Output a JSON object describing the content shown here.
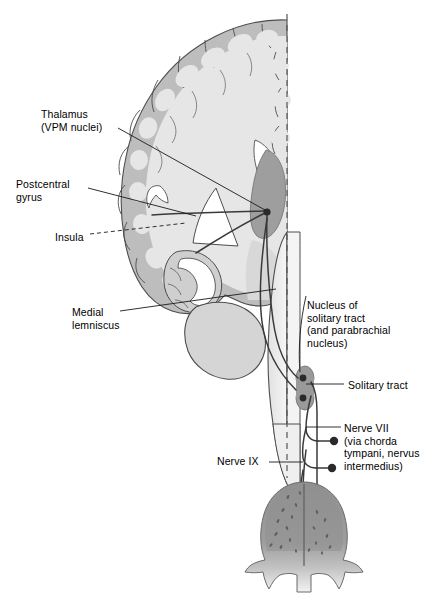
{
  "figure": {
    "midline_style": "dashed"
  },
  "labels": [
    {
      "id": "thalamus",
      "name": "label-thalamus",
      "text": "Thalamus\n(VPM nuclei)",
      "x": 41,
      "y": 108,
      "leader": "solid"
    },
    {
      "id": "postcentral-gyrus",
      "name": "label-postcentral-gyrus",
      "text": "Postcentral\ngyrus",
      "x": 16,
      "y": 178,
      "leader": "solid"
    },
    {
      "id": "insula",
      "name": "label-insula",
      "text": "Insula",
      "x": 55,
      "y": 231,
      "leader": "dashed"
    },
    {
      "id": "medial-lemniscus",
      "name": "label-medial-lemniscus",
      "text": "Medial\nlemniscus",
      "x": 72,
      "y": 306,
      "leader": "solid"
    },
    {
      "id": "nucleus-solitary-tract",
      "name": "label-nucleus-of-solitary-tract",
      "text": "Nucleus of\nsolitary tract\n(and parabrachial\nnucleus)",
      "x": 307,
      "y": 299,
      "leader": "solid"
    },
    {
      "id": "solitary-tract",
      "name": "label-solitary-tract",
      "text": "Solitary tract",
      "x": 348,
      "y": 379,
      "leader": "solid"
    },
    {
      "id": "nerve-vii",
      "name": "label-nerve-vii",
      "text": "Nerve VII\n(via chorda\ntympani, nervus\nintermedius)",
      "x": 344,
      "y": 422,
      "leader": "solid"
    },
    {
      "id": "nerve-ix",
      "name": "label-nerve-ix",
      "text": "Nerve IX",
      "x": 217,
      "y": 455,
      "leader": "solid"
    }
  ],
  "structures": [
    {
      "id": "cerebral-cortex",
      "name": "cerebral-cortex",
      "color": "#bdbdbd"
    },
    {
      "id": "cerebral-white-matter",
      "name": "cerebral-white-matter",
      "color": "#e3e3e3"
    },
    {
      "id": "lateral-ventricle",
      "name": "lateral-ventricle",
      "color": "#ffffff"
    },
    {
      "id": "thalamus-nucleus",
      "name": "thalamus-vpm-nucleus",
      "color": "#9e9e9e"
    },
    {
      "id": "temporal-lobe",
      "name": "temporal-lobe",
      "color": "#d9d9d9"
    },
    {
      "id": "brainstem",
      "name": "brainstem",
      "color": "#ececec"
    },
    {
      "id": "solitary-nucleus",
      "name": "solitary-nucleus",
      "color": "#9a9a9a"
    },
    {
      "id": "tongue",
      "name": "tongue",
      "color": "#9a9a9a"
    },
    {
      "id": "taste-pathway-fibers",
      "name": "taste-pathway-fibers",
      "color": "#3a3a3a"
    },
    {
      "id": "midline",
      "name": "midline-dashed",
      "color": "#555555"
    }
  ],
  "colors": {
    "background": "#ffffff",
    "cortex_gray": "#bdbdbd",
    "white_matter": "#e3e3e3",
    "nucleus_gray": "#9a9a9a",
    "outline": "#4a4a4a",
    "fiber": "#3a3a3a",
    "text": "#000000"
  }
}
